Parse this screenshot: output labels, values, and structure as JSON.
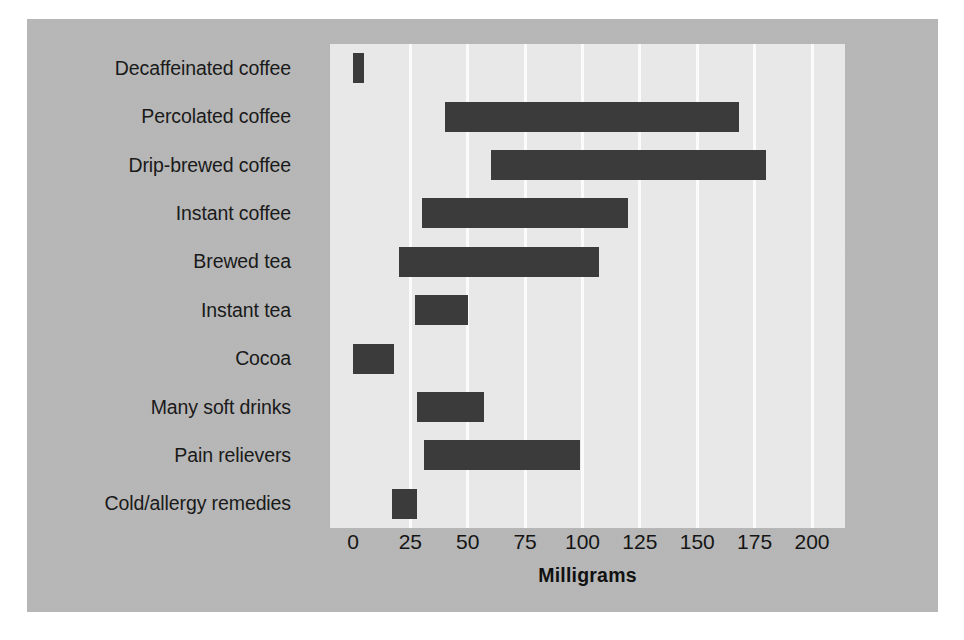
{
  "chart_data": {
    "type": "bar",
    "orientation": "horizontal",
    "bar_style": "range",
    "title": "",
    "xlabel": "Milligrams",
    "ylabel": "",
    "xlim": [
      0,
      200
    ],
    "xticks": [
      "0",
      "25",
      "50",
      "75",
      "100",
      "125",
      "150",
      "175",
      "200"
    ],
    "xtick_values": [
      0,
      25,
      50,
      75,
      100,
      125,
      150,
      175,
      200
    ],
    "grid": "vertical",
    "legend": "none",
    "categories": [
      "Decaffeinated coffee",
      "Percolated coffee",
      "Drip-brewed coffee",
      "Instant coffee",
      "Brewed tea",
      "Instant tea",
      "Cocoa",
      "Many soft drinks",
      "Pain relievers",
      "Cold/allergy remedies"
    ],
    "ranges": [
      {
        "category": "Decaffeinated coffee",
        "start": 0,
        "end": 5
      },
      {
        "category": "Percolated coffee",
        "start": 40,
        "end": 168
      },
      {
        "category": "Drip-brewed coffee",
        "start": 60,
        "end": 180
      },
      {
        "category": "Instant coffee",
        "start": 30,
        "end": 120
      },
      {
        "category": "Brewed tea",
        "start": 20,
        "end": 107
      },
      {
        "category": "Instant tea",
        "start": 27,
        "end": 50
      },
      {
        "category": "Cocoa",
        "start": 0,
        "end": 18
      },
      {
        "category": "Many soft drinks",
        "start": 28,
        "end": 57
      },
      {
        "category": "Pain relievers",
        "start": 31,
        "end": 99
      },
      {
        "category": "Cold/allergy remedies",
        "start": 17,
        "end": 28
      }
    ],
    "colors": {
      "bar": "#3b3b3b",
      "plot_background": "#e8e8e8",
      "figure_background": "#b9b9b9",
      "gridline": "#fbfbfb",
      "text": "#151515"
    }
  }
}
